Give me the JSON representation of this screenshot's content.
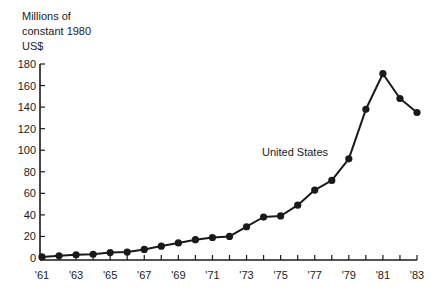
{
  "chart_data": {
    "type": "line",
    "title": "",
    "ylabel_lines": [
      "Millions of",
      "constant 1980",
      "US$"
    ],
    "ylabel": "Millions of constant 1980 US$",
    "xlabel": "",
    "ylim": [
      0,
      180
    ],
    "yticks": [
      0,
      20,
      40,
      60,
      80,
      100,
      120,
      140,
      160,
      180
    ],
    "xtick_labels": [
      "'61",
      "'63",
      "'65",
      "'67",
      "'69",
      "'71",
      "'73",
      "'75",
      "'77",
      "'79",
      "'81",
      "'83"
    ],
    "x": [
      1961,
      1962,
      1963,
      1964,
      1965,
      1966,
      1967,
      1968,
      1969,
      1970,
      1971,
      1972,
      1973,
      1974,
      1975,
      1976,
      1977,
      1978,
      1979,
      1980,
      1981,
      1982,
      1983
    ],
    "series": [
      {
        "name": "United States",
        "values": [
          1,
          2,
          3,
          3.5,
          5,
          5.5,
          8,
          11,
          14,
          17,
          19,
          20,
          29,
          38,
          39,
          49,
          63,
          72,
          92,
          138,
          171,
          148,
          135
        ]
      }
    ],
    "annotations": [
      {
        "text": "United States",
        "x": 1976.5,
        "y": 98
      }
    ],
    "grid": false,
    "legend": "none"
  }
}
